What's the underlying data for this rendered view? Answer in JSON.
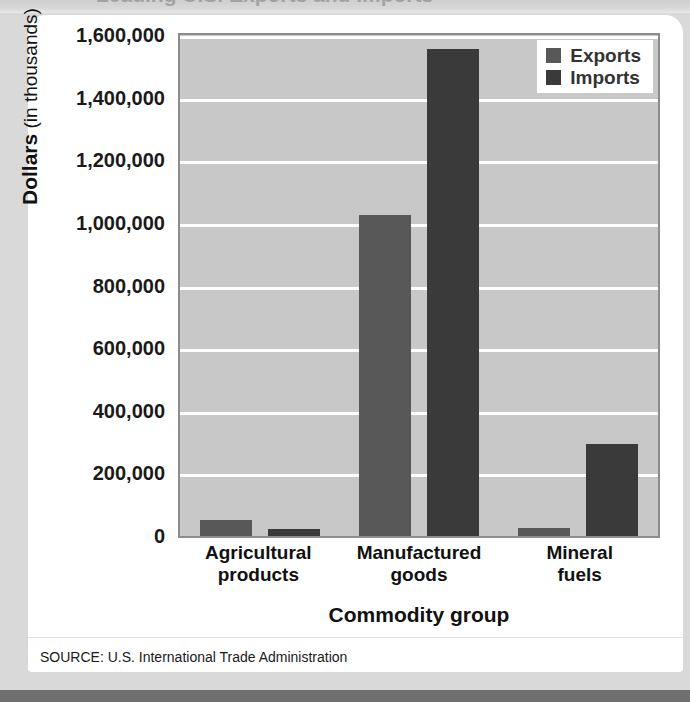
{
  "page": {
    "title_remnant": "Leading U.S. Exports and Imports"
  },
  "source_note": "SOURCE: U.S. International Trade Administration",
  "legend": {
    "items": [
      {
        "label": "Exports",
        "color": "#585858",
        "swatch": "exports-swatch"
      },
      {
        "label": "Imports",
        "color": "#3a3a3a",
        "swatch": "imports-swatch"
      }
    ]
  },
  "axes": {
    "y_label_bold": "Dollars",
    "y_label_rest": " (in thousands)",
    "x_title": "Commodity group"
  },
  "chart_data": {
    "type": "bar",
    "title": "",
    "xlabel": "Commodity group",
    "ylabel": "Dollars (in thousands)",
    "ylim": [
      0,
      1600000
    ],
    "ytick_values": [
      0,
      200000,
      400000,
      600000,
      800000,
      1000000,
      1200000,
      1400000,
      1600000
    ],
    "ytick_labels": [
      "0",
      "200,000",
      "400,000",
      "600,000",
      "800,000",
      "1,000,000",
      "1,200,000",
      "1,400,000",
      "1,600,000"
    ],
    "grid": true,
    "grid_color": "#ffffff",
    "plot_background": "#c8c8c8",
    "legend_position": "top-right",
    "categories": [
      "Agricultural products",
      "Manufactured goods",
      "Mineral fuels"
    ],
    "category_lines": [
      [
        "Agricultural",
        "products"
      ],
      [
        "Manufactured",
        "goods"
      ],
      [
        "Mineral",
        "fuels"
      ]
    ],
    "series": [
      {
        "name": "Exports",
        "color": "#585858",
        "values": [
          50000,
          1025000,
          25000
        ]
      },
      {
        "name": "Imports",
        "color": "#3a3a3a",
        "values": [
          23000,
          1555000,
          293000
        ]
      }
    ]
  }
}
